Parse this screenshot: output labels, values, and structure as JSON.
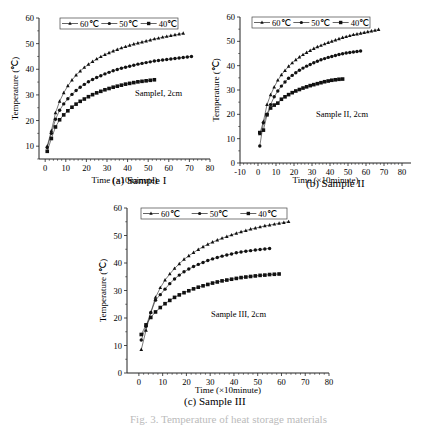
{
  "figure_caption": "Fig. 3. Temperature of heat storage materials",
  "chart_data": [
    {
      "type": "line",
      "title": "(a) Sample I",
      "annotation": "SampleI, 2cm",
      "xlabel": "Time (×10minute)",
      "ylabel": "Temperature (℃)",
      "xlim": [
        -3,
        80
      ],
      "ylim": [
        5,
        60
      ],
      "xticks": [
        0,
        10,
        20,
        30,
        40,
        50,
        60,
        70,
        80
      ],
      "yticks": [
        10,
        20,
        30,
        40,
        50,
        60
      ],
      "legend": [
        "60℃",
        "50℃",
        "40℃"
      ],
      "legend_position": "top",
      "series": [
        {
          "name": "60℃",
          "marker": "triangle",
          "x": [
            1,
            3,
            5,
            7,
            9,
            11,
            13,
            15,
            17,
            19,
            21,
            23,
            25,
            27,
            29,
            31,
            33,
            35,
            37,
            39,
            41,
            43,
            45,
            47,
            49,
            51,
            53,
            55,
            57,
            59,
            61,
            63,
            65,
            67
          ],
          "y": [
            10,
            16,
            23,
            27.5,
            30.8,
            33.5,
            35.8,
            37.7,
            39.3,
            40.7,
            41.9,
            43,
            44,
            44.9,
            45.7,
            46.4,
            47.1,
            47.7,
            48.3,
            48.8,
            49.3,
            49.8,
            50.2,
            50.6,
            51,
            51.4,
            51.8,
            52.1,
            52.5,
            52.8,
            53.1,
            53.4,
            53.7,
            54
          ]
        },
        {
          "name": "50℃",
          "marker": "circle",
          "x": [
            1,
            3,
            5,
            7,
            9,
            11,
            13,
            15,
            17,
            19,
            21,
            23,
            25,
            27,
            29,
            31,
            33,
            35,
            37,
            39,
            41,
            43,
            45,
            47,
            49,
            51,
            53,
            55,
            57,
            59,
            61,
            63,
            65,
            67,
            69,
            71
          ],
          "y": [
            9.5,
            15,
            20.5,
            24,
            26.5,
            28.5,
            30.2,
            31.7,
            33,
            34.1,
            35.1,
            36,
            36.8,
            37.5,
            38.2,
            38.8,
            39.4,
            39.9,
            40.4,
            40.8,
            41.2,
            41.6,
            42,
            42.3,
            42.6,
            42.9,
            43.2,
            43.4,
            43.6,
            43.8,
            44,
            44.2,
            44.4,
            44.6,
            44.8,
            45
          ]
        },
        {
          "name": "40℃",
          "marker": "square",
          "x": [
            1,
            3,
            5,
            7,
            9,
            11,
            13,
            15,
            17,
            19,
            21,
            23,
            25,
            27,
            29,
            31,
            33,
            35,
            37,
            39,
            41,
            43,
            45,
            47,
            49,
            51,
            53
          ],
          "y": [
            8,
            13,
            17.5,
            20.3,
            22.2,
            23.8,
            25.2,
            26.4,
            27.5,
            28.4,
            29.3,
            30.1,
            30.8,
            31.4,
            32,
            32.5,
            33,
            33.4,
            33.8,
            34.2,
            34.5,
            34.8,
            35.1,
            35.3,
            35.5,
            35.7,
            35.9
          ]
        }
      ]
    },
    {
      "type": "line",
      "title": "(b) Sample II",
      "annotation": "Sample II, 2cm",
      "xlabel": "Time (×10minute)",
      "ylabel": "Temperature (℃)",
      "xlim": [
        -10,
        85
      ],
      "ylim": [
        0,
        60
      ],
      "xticks": [
        -10,
        0,
        10,
        20,
        30,
        40,
        50,
        60,
        70,
        80
      ],
      "yticks": [
        0,
        10,
        20,
        30,
        40,
        50,
        60
      ],
      "legend": [
        "60℃",
        "50℃",
        "40℃"
      ],
      "legend_position": "top",
      "series": [
        {
          "name": "60℃",
          "marker": "triangle",
          "x": [
            1,
            3,
            5,
            7,
            9,
            11,
            13,
            15,
            17,
            19,
            21,
            23,
            25,
            27,
            29,
            31,
            33,
            35,
            37,
            39,
            41,
            43,
            45,
            47,
            49,
            51,
            53,
            55,
            57,
            59,
            61,
            63,
            65,
            67
          ],
          "y": [
            12,
            17,
            24,
            28,
            31.2,
            34,
            36.2,
            38,
            39.7,
            41.1,
            42.4,
            43.5,
            44.5,
            45.4,
            46.2,
            47,
            47.7,
            48.3,
            48.9,
            49.5,
            50,
            50.5,
            51,
            51.5,
            51.9,
            52.3,
            52.7,
            53,
            53.3,
            53.6,
            53.9,
            54.2,
            54.5,
            54.8
          ]
        },
        {
          "name": "50℃",
          "marker": "circle",
          "x": [
            1,
            3,
            5,
            7,
            9,
            11,
            13,
            15,
            17,
            19,
            21,
            23,
            25,
            27,
            29,
            31,
            33,
            35,
            37,
            39,
            41,
            43,
            45,
            47,
            49,
            51,
            53,
            55,
            57
          ],
          "y": [
            7,
            16.5,
            20,
            24,
            27.2,
            29.6,
            31.6,
            33.3,
            34.8,
            36,
            37.1,
            38.1,
            39,
            39.8,
            40.5,
            41.2,
            41.8,
            42.4,
            42.9,
            43.4,
            43.8,
            44.2,
            44.6,
            44.9,
            45.2,
            45.4,
            45.6,
            45.8,
            46
          ]
        },
        {
          "name": "40℃",
          "marker": "square",
          "x": [
            1,
            3,
            5,
            7,
            9,
            11,
            13,
            15,
            17,
            19,
            21,
            23,
            25,
            27,
            29,
            31,
            33,
            35,
            37,
            39,
            41,
            43,
            45,
            47
          ],
          "y": [
            12.5,
            13.5,
            19.8,
            22.6,
            23.8,
            24.6,
            26.2,
            27.2,
            28.1,
            28.9,
            29.6,
            30.2,
            30.8,
            31.3,
            31.8,
            32.2,
            32.6,
            33,
            33.4,
            33.7,
            34,
            34.2,
            34.4,
            34.5
          ]
        }
      ]
    },
    {
      "type": "line",
      "title": "(c) Sample III",
      "annotation": "Sample III, 2cm",
      "xlabel": "Time (×10minute)",
      "ylabel": "Temperature (℃)",
      "xlim": [
        -5,
        80
      ],
      "ylim": [
        0,
        60
      ],
      "xticks": [
        0,
        10,
        20,
        30,
        40,
        50,
        60,
        70,
        80
      ],
      "yticks": [
        0,
        10,
        20,
        30,
        40,
        50,
        60
      ],
      "legend": [
        "60℃",
        "50℃",
        "40℃"
      ],
      "legend_position": "top",
      "series": [
        {
          "name": "60℃",
          "marker": "triangle",
          "x": [
            1,
            3,
            5,
            7,
            9,
            11,
            13,
            15,
            17,
            19,
            21,
            23,
            25,
            27,
            29,
            31,
            33,
            35,
            37,
            39,
            41,
            43,
            45,
            47,
            49,
            51,
            53,
            55,
            57,
            59,
            61,
            63
          ],
          "y": [
            8.5,
            15.5,
            22,
            27.5,
            31,
            33.8,
            36,
            38,
            39.7,
            41.3,
            42.6,
            43.8,
            44.9,
            45.9,
            46.8,
            47.6,
            48.3,
            49,
            49.6,
            50.2,
            50.8,
            51.3,
            51.8,
            52.3,
            52.7,
            53.1,
            53.5,
            53.8,
            54.1,
            54.4,
            54.7,
            55
          ]
        },
        {
          "name": "50℃",
          "marker": "circle",
          "x": [
            1,
            3,
            5,
            7,
            9,
            11,
            13,
            15,
            17,
            19,
            21,
            23,
            25,
            27,
            29,
            31,
            33,
            35,
            37,
            39,
            41,
            43,
            45,
            47,
            49,
            51,
            53,
            55
          ],
          "y": [
            12,
            17,
            22,
            26.5,
            28.5,
            30.5,
            32.5,
            34.2,
            35.6,
            36.8,
            37.8,
            38.7,
            39.5,
            40.2,
            40.9,
            41.5,
            42,
            42.5,
            42.9,
            43.3,
            43.7,
            44,
            44.3,
            44.5,
            44.7,
            44.9,
            45.1,
            45.3
          ]
        },
        {
          "name": "40℃",
          "marker": "square",
          "x": [
            1,
            3,
            5,
            7,
            9,
            11,
            13,
            15,
            17,
            19,
            21,
            23,
            25,
            27,
            29,
            31,
            33,
            35,
            37,
            39,
            41,
            43,
            45,
            47,
            49,
            51,
            53,
            55,
            57,
            59
          ],
          "y": [
            14,
            17.5,
            20.2,
            22.2,
            23.8,
            25.2,
            26.4,
            27.5,
            28.4,
            29.2,
            29.9,
            30.6,
            31.2,
            31.7,
            32.2,
            32.7,
            33.1,
            33.5,
            33.8,
            34.1,
            34.4,
            34.7,
            34.9,
            35.1,
            35.3,
            35.5,
            35.6,
            35.8,
            35.9,
            36
          ]
        }
      ]
    }
  ]
}
